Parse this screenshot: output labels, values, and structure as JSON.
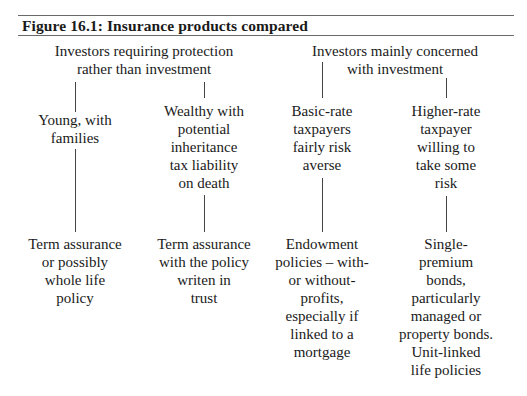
{
  "figure": {
    "title": "Figure 16.1: Insurance products compared"
  },
  "groups": [
    {
      "label_lines": [
        "Investors requiring protection",
        "rather than investment"
      ],
      "branches": [
        {
          "profile_lines": [
            "Young, with",
            "families"
          ],
          "product_lines": [
            "Term assurance",
            "or possibly",
            "whole life",
            "policy"
          ]
        },
        {
          "profile_lines": [
            "Wealthy with",
            "potential",
            "inheritance",
            "tax liability",
            "on death"
          ],
          "product_lines": [
            "Term assurance",
            "with the policy",
            "writen in",
            "trust"
          ]
        }
      ]
    },
    {
      "label_lines": [
        "Investors mainly concerned",
        "with investment"
      ],
      "branches": [
        {
          "profile_lines": [
            "Basic-rate",
            "taxpayers",
            "fairly risk",
            "averse"
          ],
          "product_lines": [
            "Endowment",
            "policies – with-",
            "or without-",
            "profits,",
            "especially if",
            "linked to a",
            "mortgage"
          ]
        },
        {
          "profile_lines": [
            "Higher-rate",
            "taxpayer",
            "willing to",
            "take some",
            "risk"
          ],
          "product_lines": [
            "Single-",
            "premium",
            "bonds,",
            "particularly",
            "managed or",
            "property bonds.",
            "Unit-linked",
            "life policies"
          ]
        }
      ]
    }
  ]
}
